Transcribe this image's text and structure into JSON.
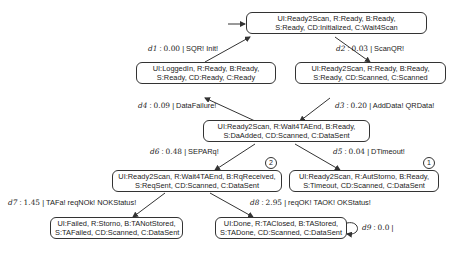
{
  "diagram": {
    "type": "state-transition-graph",
    "nodes": [
      {
        "id": "s0",
        "line1": "UI:Ready2Scan, R:Ready, B:Ready,",
        "line2": "S:Ready, CD:Initialized, C:Wait4Scan",
        "initial": true
      },
      {
        "id": "s1",
        "line1": "UI:LoggedIn, R:Ready, B:Ready,",
        "line2": "S:Ready, CD:Ready, C:Ready"
      },
      {
        "id": "s2",
        "line1": "UI:Ready2Scan, R:Ready, B:Ready,",
        "line2": "S:Ready, CD:Scanned, C:Scanned"
      },
      {
        "id": "s3",
        "line1": "UI:Ready2Scan, R:Wait4TAEnd, B:Ready,",
        "line2": "S:DaAdded, CD:Scanned, C:DataSent"
      },
      {
        "id": "s4",
        "line1": "UI:Ready2Scan, R:Wait4TAEnd, B:RqReceived,",
        "line2": "S:ReqSent, CD:Scanned, C:DataSent",
        "marker": "2"
      },
      {
        "id": "s5",
        "line1": "UI:Ready2Scan, R:AutStorno, B:Ready,",
        "line2": "S:Timeout, CD:Scanned, C:DataSent",
        "marker": "1"
      },
      {
        "id": "s6",
        "line1": "UI:Failed, R:Storno, B:TANotStored,",
        "line2": "S:TAFailed, CD:Scanned, C:DataSent"
      },
      {
        "id": "s7",
        "line1": "UI:Done, R:TAClosed, B:TAStored,",
        "line2": "S:TADone, CD:Scanned, C:DataSent"
      }
    ],
    "edges": [
      {
        "from": "s1",
        "to": "s0",
        "delay": "d1",
        "value": "0.00",
        "actions": "SQR! Init!"
      },
      {
        "from": "s0",
        "to": "s2",
        "delay": "d2",
        "value": "0.03",
        "actions": "ScanQR!"
      },
      {
        "from": "s2",
        "to": "s3",
        "delay": "d3",
        "value": "0.20",
        "actions": "AddData! QRData!"
      },
      {
        "from": "s3",
        "to": "s1",
        "delay": "d4",
        "value": "0.09",
        "actions": "DataFailure!"
      },
      {
        "from": "s3",
        "to": "s5",
        "delay": "d5",
        "value": "0.04",
        "actions": "DTimeout!"
      },
      {
        "from": "s3",
        "to": "s4",
        "delay": "d6",
        "value": "0.48",
        "actions": "SEPARq!"
      },
      {
        "from": "s4",
        "to": "s6",
        "delay": "d7",
        "value": "1.45",
        "actions": "TAFa! reqNOk! NOKStatus!"
      },
      {
        "from": "s4",
        "to": "s7",
        "delay": "d8",
        "value": "2.95",
        "actions": "reqOK! TAOK! OKStatus!"
      },
      {
        "from": "s7",
        "to": "s7",
        "delay": "d9",
        "value": "0.0",
        "actions": ""
      }
    ]
  }
}
